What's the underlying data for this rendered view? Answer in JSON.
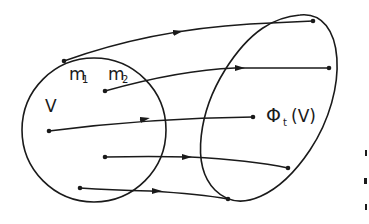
{
  "diagram": {
    "type": "phase-flow",
    "labels": {
      "m1": "m",
      "m1_sub": "1",
      "m2": "m",
      "m2_sub": "2",
      "region": "V",
      "image_phi": "Φ",
      "image_sub": "t",
      "image_arg": "(V)"
    },
    "colors": {
      "ink": "#1a1a1a",
      "background": "#ffffff"
    },
    "regions": [
      {
        "name": "V",
        "shape": "circle"
      },
      {
        "name": "Φt(V)",
        "shape": "ellipse"
      }
    ],
    "trajectories": 6
  }
}
